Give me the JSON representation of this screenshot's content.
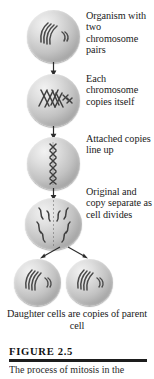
{
  "figure": {
    "number": "FIGURE 2.5",
    "caption_partial": "The process of mitosis in the",
    "rule_color": "#1d1d1d"
  },
  "stages": [
    {
      "id": "stage-1",
      "cell_name": "cell-stage-1",
      "label": "Organism with two chromosome pairs",
      "arrow": "arrow-down"
    },
    {
      "id": "stage-2",
      "cell_name": "cell-stage-2",
      "label": "Each chromosome copies itself",
      "arrow": "arrow-down"
    },
    {
      "id": "stage-3",
      "cell_name": "cell-stage-3",
      "label": "Attached copies line up",
      "arrow": "arrow-down"
    },
    {
      "id": "stage-4",
      "cell_name": "cell-stage-4",
      "label": "Original and copy separate as cell divides",
      "arrow": "arrow-split"
    }
  ],
  "daughter": {
    "label": "Daughter cells are copies of parent cell",
    "cells": [
      "cell-daughter-left",
      "cell-daughter-right"
    ]
  },
  "colors": {
    "cell_highlight": "#f2f2f2",
    "cell_midtone": "#c2c2c2",
    "cell_shadow": "#7e7e7e",
    "chromosome": "#4a4a4a",
    "text": "#1a1a1a",
    "background": "#ffffff"
  }
}
